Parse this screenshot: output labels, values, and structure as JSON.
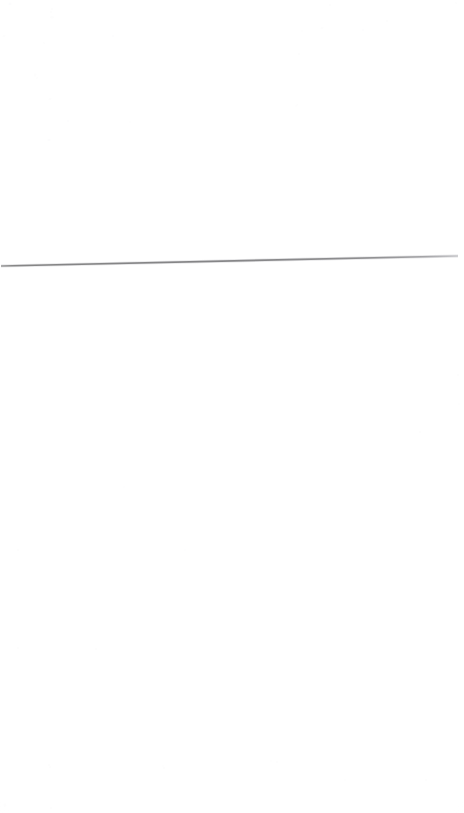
{
  "page": {
    "width": 464,
    "height": 813,
    "background_color": "#ffffff",
    "kind": "scanned-blank-page",
    "visible_content_summary": "",
    "above_rule_text": "",
    "below_rule_text": ""
  },
  "rule": {
    "name": "horizontal-rule",
    "color": "#8a8a8a",
    "color_faded_end": "#b5b5b5",
    "thickness_px": 2,
    "x_start": 1,
    "y_start": 266,
    "x_end": 458,
    "y_end": 256,
    "length_px": 457,
    "tilt_px": -10,
    "label": ""
  },
  "noise": {
    "name": "scanner-speckle",
    "color": "#f2f2f4",
    "dots": [
      {
        "x": 10,
        "y": 4,
        "r": 1.4,
        "o": 0.35
      },
      {
        "x": 52,
        "y": 9,
        "r": 1.0,
        "o": 0.25
      },
      {
        "x": 330,
        "y": 5,
        "r": 1.2,
        "o": 0.3
      },
      {
        "x": 456,
        "y": 3,
        "r": 1.1,
        "o": 0.28
      },
      {
        "x": 51,
        "y": 12,
        "r": 1.3,
        "o": 0.3
      },
      {
        "x": 52,
        "y": 17,
        "r": 1.5,
        "o": 0.33
      },
      {
        "x": 4,
        "y": 36,
        "r": 1.2,
        "o": 0.26
      },
      {
        "x": 44,
        "y": 43,
        "r": 1.1,
        "o": 0.24
      },
      {
        "x": 113,
        "y": 36,
        "r": 1.0,
        "o": 0.22
      },
      {
        "x": 322,
        "y": 28,
        "r": 1.2,
        "o": 0.26
      },
      {
        "x": 363,
        "y": 30,
        "r": 1.0,
        "o": 0.22
      },
      {
        "x": 35,
        "y": 75,
        "r": 1.4,
        "o": 0.32
      },
      {
        "x": 37,
        "y": 78,
        "r": 1.1,
        "o": 0.25
      },
      {
        "x": 68,
        "y": 121,
        "r": 1.0,
        "o": 0.22
      },
      {
        "x": 50,
        "y": 99,
        "r": 1.2,
        "o": 0.25
      },
      {
        "x": 130,
        "y": 122,
        "r": 1.1,
        "o": 0.23
      },
      {
        "x": 297,
        "y": 105,
        "r": 1.0,
        "o": 0.2
      },
      {
        "x": 49,
        "y": 140,
        "r": 1.3,
        "o": 0.27
      },
      {
        "x": 296,
        "y": 106,
        "r": 1.2,
        "o": 0.22
      },
      {
        "x": 299,
        "y": 54,
        "r": 1.0,
        "o": 0.2
      },
      {
        "x": 302,
        "y": 31,
        "r": 1.1,
        "o": 0.22
      },
      {
        "x": 387,
        "y": 21,
        "r": 1.0,
        "o": 0.2
      },
      {
        "x": 458,
        "y": 375,
        "r": 1.2,
        "o": 0.24
      },
      {
        "x": 459,
        "y": 404,
        "r": 1.1,
        "o": 0.22
      },
      {
        "x": 18,
        "y": 648,
        "r": 1.3,
        "o": 0.26
      },
      {
        "x": 96,
        "y": 649,
        "r": 1.0,
        "o": 0.2
      },
      {
        "x": 271,
        "y": 761,
        "r": 1.1,
        "o": 0.22
      },
      {
        "x": 277,
        "y": 762,
        "r": 1.0,
        "o": 0.2
      },
      {
        "x": 49,
        "y": 765,
        "r": 1.2,
        "o": 0.24
      },
      {
        "x": 50,
        "y": 767,
        "r": 1.0,
        "o": 0.2
      },
      {
        "x": 163,
        "y": 766,
        "r": 1.1,
        "o": 0.22
      },
      {
        "x": 164,
        "y": 768,
        "r": 1.0,
        "o": 0.2
      },
      {
        "x": 345,
        "y": 780,
        "r": 1.1,
        "o": 0.22
      },
      {
        "x": 426,
        "y": 780,
        "r": 1.0,
        "o": 0.2
      },
      {
        "x": 5,
        "y": 805,
        "r": 1.4,
        "o": 0.28
      },
      {
        "x": 51,
        "y": 808,
        "r": 1.2,
        "o": 0.24
      },
      {
        "x": 18,
        "y": 550,
        "r": 1.0,
        "o": 0.2
      },
      {
        "x": 185,
        "y": 550,
        "r": 1.1,
        "o": 0.21
      },
      {
        "x": 420,
        "y": 432,
        "r": 1.0,
        "o": 0.2
      },
      {
        "x": 124,
        "y": 487,
        "r": 1.1,
        "o": 0.21
      }
    ]
  }
}
